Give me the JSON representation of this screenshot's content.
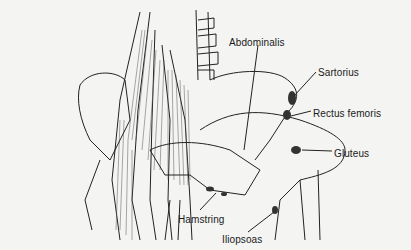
{
  "figure": {
    "labels": [
      {
        "id": "abdominalis",
        "text": "Abdominalis",
        "x": 229,
        "y": 37
      },
      {
        "id": "sartorius",
        "text": "Sartorius",
        "x": 318,
        "y": 67
      },
      {
        "id": "rectus-femoris",
        "text": "Rectus femoris",
        "x": 313,
        "y": 108
      },
      {
        "id": "gluteus",
        "text": "Gluteus",
        "x": 334,
        "y": 148
      },
      {
        "id": "hamstring",
        "text": "Hamstring",
        "x": 178,
        "y": 214
      },
      {
        "id": "iliopsoas",
        "text": "Iliopsoas",
        "x": 222,
        "y": 234
      }
    ],
    "colors": {
      "background": "#f4f4f2",
      "ink": "#1a1a1a"
    }
  }
}
